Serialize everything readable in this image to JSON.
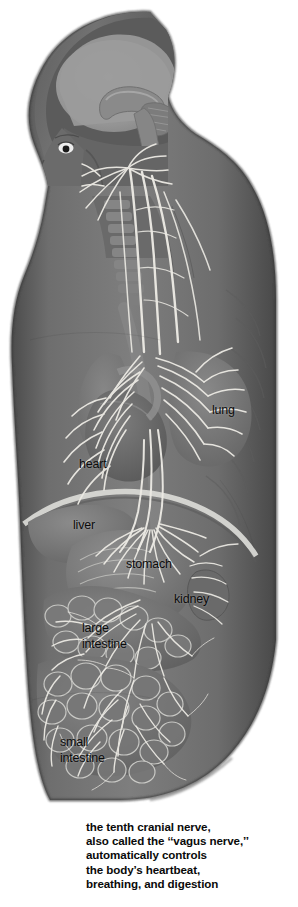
{
  "figure": {
    "view": "sagittal half-body cutaway, head and torso",
    "style": "grayscale airbrush anatomical plate",
    "background_color": "#ffffff",
    "body_fill_color": "#6f6f6f",
    "nerve_color": "#e8e8e4",
    "brain_color": "#9a9a9a",
    "skull_color": "#5a5a5a"
  },
  "labels": [
    {
      "key": "lung",
      "text": "lung",
      "x": 212,
      "y": 403
    },
    {
      "key": "heart",
      "text": "heart",
      "x": 79,
      "y": 457
    },
    {
      "key": "liver",
      "text": "liver",
      "x": 73,
      "y": 518
    },
    {
      "key": "stomach",
      "text": "stomach",
      "x": 126,
      "y": 557
    },
    {
      "key": "kidney",
      "text": "kidney",
      "x": 174,
      "y": 592
    },
    {
      "key": "large-intestine",
      "line1": "large",
      "line2": "intestine",
      "x": 82,
      "y": 620
    },
    {
      "key": "small-intestine",
      "line1": "small",
      "line2": "intestine",
      "x": 60,
      "y": 734
    }
  ],
  "caption": {
    "line1": "the tenth cranial nerve,",
    "line2": "also called the ‘‘vagus nerve,’’",
    "line3": "automatically controls",
    "line4": "the body’s heartbeat,",
    "line5": "breathing, and digestion"
  }
}
